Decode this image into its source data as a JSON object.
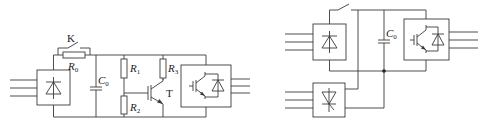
{
  "diagram": {
    "type": "circuit-schematic",
    "left_circuit": {
      "labels": {
        "switch": "K",
        "resistor_r0": "R",
        "resistor_r0_sub": "0",
        "capacitor": "C",
        "capacitor_sub": "0",
        "resistor_r1": "R",
        "resistor_r1_sub": "1",
        "resistor_r2": "R",
        "resistor_r2_sub": "2",
        "resistor_r3": "R",
        "resistor_r3_sub": "3",
        "transistor": "T"
      },
      "components": [
        "3-phase input",
        "rectifier (diode bridge)",
        "switch K",
        "precharge resistor R0",
        "DC link capacitor C0",
        "R1",
        "R2",
        "R3",
        "transistor T",
        "IGBT inverter",
        "3-phase output"
      ]
    },
    "right_circuit": {
      "labels": {
        "capacitor": "C",
        "capacitor_sub": "0"
      },
      "components": [
        "3-phase input (upper)",
        "diode rectifier",
        "switch",
        "3-phase input (lower)",
        "thyristor rectifier",
        "DC link capacitor C0",
        "junction node",
        "IGBT inverter",
        "3-phase output"
      ]
    }
  }
}
